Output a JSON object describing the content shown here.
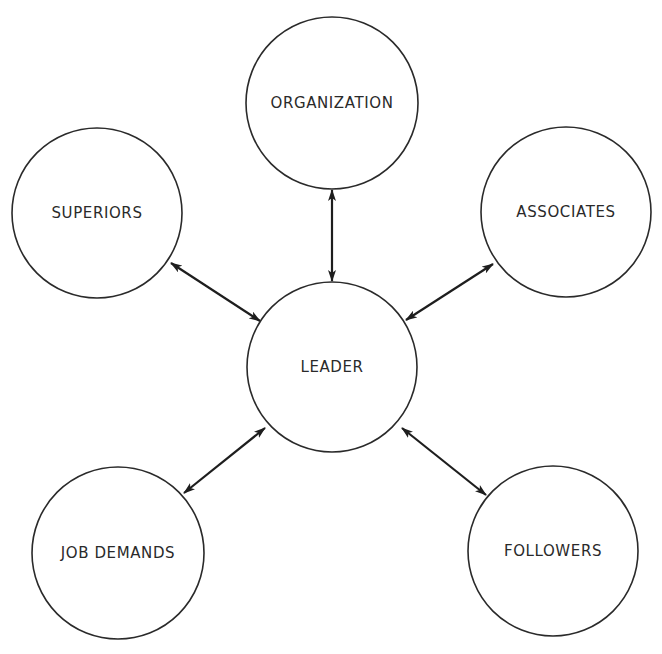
{
  "diagram": {
    "type": "hub-and-spoke",
    "background": "#ffffff",
    "stroke_color": "#2a2a2a",
    "center": {
      "id": "leader",
      "label": "LEADER",
      "cx": 332,
      "cy": 367,
      "r": 85
    },
    "nodes": [
      {
        "id": "organization",
        "label": "ORGANIZATION",
        "cx": 332,
        "cy": 103,
        "r": 86
      },
      {
        "id": "superiors",
        "label": "SUPERIORS",
        "cx": 97,
        "cy": 213,
        "r": 85
      },
      {
        "id": "associates",
        "label": "ASSOCIATES",
        "cx": 566,
        "cy": 212,
        "r": 85
      },
      {
        "id": "job-demands",
        "label": "JOB DEMANDS",
        "cx": 118,
        "cy": 553,
        "r": 86
      },
      {
        "id": "followers",
        "label": "FOLLOWERS",
        "cx": 553,
        "cy": 551,
        "r": 85
      }
    ],
    "edges": [
      {
        "from": "leader",
        "to": "organization",
        "direction": "bidirectional",
        "x1": 332,
        "y1": 281,
        "x2": 332,
        "y2": 190
      },
      {
        "from": "leader",
        "to": "superiors",
        "direction": "bidirectional",
        "x1": 260,
        "y1": 321,
        "x2": 171,
        "y2": 263
      },
      {
        "from": "leader",
        "to": "associates",
        "direction": "bidirectional",
        "x1": 406,
        "y1": 320,
        "x2": 493,
        "y2": 264
      },
      {
        "from": "leader",
        "to": "job-demands",
        "direction": "bidirectional",
        "x1": 265,
        "y1": 428,
        "x2": 184,
        "y2": 493
      },
      {
        "from": "leader",
        "to": "followers",
        "direction": "bidirectional",
        "x1": 402,
        "y1": 428,
        "x2": 486,
        "y2": 495
      }
    ]
  }
}
